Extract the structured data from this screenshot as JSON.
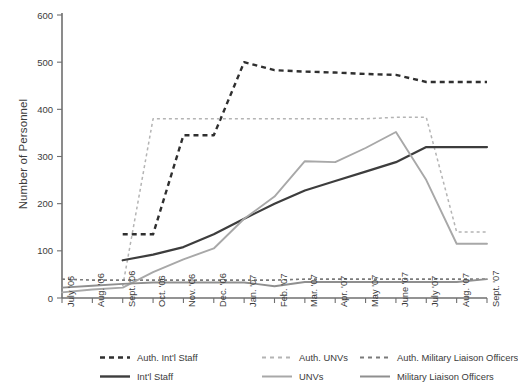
{
  "chart_data": {
    "type": "line",
    "title": "",
    "xlabel": "",
    "ylabel": "Number of Personnel",
    "ylim": [
      0,
      600
    ],
    "yticks": [
      0,
      100,
      200,
      300,
      400,
      500,
      600
    ],
    "grid": false,
    "legend_position": "bottom",
    "categories": [
      "July '06",
      "Aug. '06",
      "Sept. '06",
      "Oct. '06",
      "Nov. '06",
      "Dec. '06",
      "Jan. '07",
      "Feb. '07",
      "Mar. '07",
      "Apr. '07",
      "May '07",
      "June '07",
      "July '07",
      "Aug. '07",
      "Sept. '07"
    ],
    "series": [
      {
        "name": "Auth. Int'l Staff",
        "style": "dashed",
        "color": "#2f2f2f",
        "width": 2.4,
        "dash": "5,4",
        "values": [
          null,
          null,
          135,
          135,
          345,
          345,
          500,
          483,
          480,
          478,
          475,
          473,
          458,
          458,
          458
        ]
      },
      {
        "name": "Auth. UNVs",
        "style": "dashed",
        "color": "#b4b4b4",
        "width": 1.5,
        "dash": "3,3",
        "values": [
          null,
          null,
          25,
          380,
          380,
          380,
          380,
          380,
          380,
          380,
          380,
          383,
          383,
          140,
          140
        ]
      },
      {
        "name": "Auth. Military Liaison Officers",
        "style": "dashed",
        "color": "#7a7a7a",
        "width": 1.6,
        "dash": "3,3",
        "values": [
          40,
          38,
          38,
          38,
          38,
          38,
          38,
          38,
          40,
          40,
          40,
          40,
          40,
          40,
          40
        ]
      },
      {
        "name": "Int'l Staff",
        "style": "solid",
        "color": "#3d3d3d",
        "width": 2.2,
        "values": [
          null,
          null,
          80,
          92,
          108,
          135,
          168,
          200,
          228,
          248,
          268,
          288,
          320,
          320,
          320
        ]
      },
      {
        "name": "UNVs",
        "style": "solid",
        "color": "#a8a8a8",
        "width": 1.9,
        "values": [
          12,
          18,
          22,
          55,
          82,
          105,
          168,
          215,
          290,
          288,
          318,
          352,
          250,
          115,
          115
        ]
      },
      {
        "name": "Military Liaison Officers",
        "style": "solid",
        "color": "#8f8f8f",
        "width": 1.9,
        "values": [
          22,
          26,
          30,
          33,
          33,
          33,
          33,
          25,
          34,
          34,
          34,
          34,
          34,
          34,
          40
        ]
      }
    ]
  },
  "legend": {
    "items": [
      {
        "label": "Auth. Int'l Staff",
        "style": "dashed",
        "color": "#2f2f2f",
        "width": 2.4,
        "dash": "5,4"
      },
      {
        "label": "Auth. UNVs",
        "style": "dashed",
        "color": "#b4b4b4",
        "width": 1.8,
        "dash": "4,4"
      },
      {
        "label": "Auth. Military Liaison Officers",
        "style": "dashed",
        "color": "#7a7a7a",
        "width": 1.8,
        "dash": "4,4"
      },
      {
        "label": "Int'l Staff",
        "style": "solid",
        "color": "#3d3d3d",
        "width": 2.4
      },
      {
        "label": "UNVs",
        "style": "solid",
        "color": "#a8a8a8",
        "width": 2.0
      },
      {
        "label": "Military Liaison Officers",
        "style": "solid",
        "color": "#8f8f8f",
        "width": 2.0
      }
    ]
  },
  "axis": {
    "axis_color": "#6f6f6f"
  }
}
